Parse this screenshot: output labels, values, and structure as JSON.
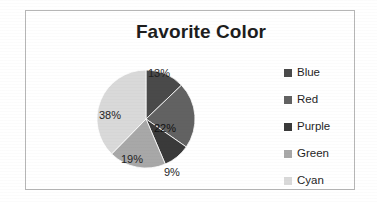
{
  "chart_data": {
    "type": "pie",
    "title": "Favorite Color",
    "categories": [
      "Blue",
      "Red",
      "Purple",
      "Green",
      "Cyan"
    ],
    "values": [
      13,
      22,
      9,
      19,
      38
    ],
    "value_labels": [
      "13%",
      "22%",
      "9%",
      "19%",
      "38%"
    ],
    "unit": "percent",
    "legend_position": "right",
    "grid": false,
    "start_angle_deg": 0,
    "direction": "clockwise",
    "slice_colors": [
      "#4a4a4a",
      "#626262",
      "#3a3a3a",
      "#a8a8a8",
      "#d9d9d9"
    ],
    "label_positions": [
      "outside",
      "inside",
      "outside",
      "inside",
      "inside"
    ]
  },
  "frame": {
    "border_color": "#b6b6b6",
    "background": "#ffffff"
  },
  "title": {
    "text": "Favorite Color",
    "color": "#1d1d1d"
  },
  "legend": {
    "items": [
      {
        "label": "Blue",
        "color": "#4a4a4a"
      },
      {
        "label": "Red",
        "color": "#626262"
      },
      {
        "label": "Purple",
        "color": "#3a3a3a"
      },
      {
        "label": "Green",
        "color": "#a8a8a8"
      },
      {
        "label": "Cyan",
        "color": "#d9d9d9"
      }
    ]
  },
  "slices": [
    {
      "name": "Blue",
      "label": "13%",
      "value": 13,
      "color": "#4a4a4a"
    },
    {
      "name": "Red",
      "label": "22%",
      "value": 22,
      "color": "#626262"
    },
    {
      "name": "Purple",
      "label": "9%",
      "value": 9,
      "color": "#3a3a3a"
    },
    {
      "name": "Green",
      "label": "19%",
      "value": 19,
      "color": "#a8a8a8"
    },
    {
      "name": "Cyan",
      "label": "38%",
      "value": 38,
      "color": "#d9d9d9"
    }
  ]
}
